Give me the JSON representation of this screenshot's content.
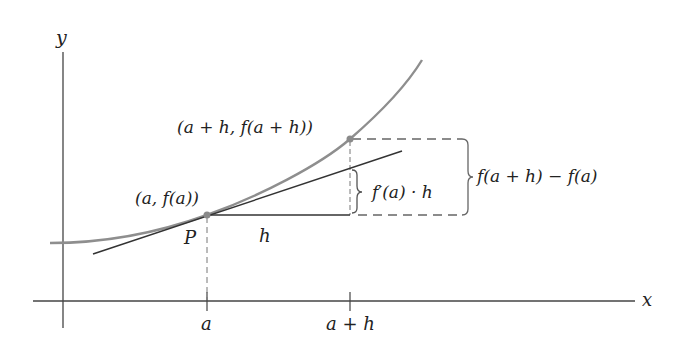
{
  "diagram": {
    "axes": {
      "x_label": "x",
      "y_label": "y",
      "ticks": [
        {
          "label": "a",
          "x": 207
        },
        {
          "label": "a + h",
          "x": 350
        }
      ]
    },
    "points": {
      "P": {
        "label": "P",
        "coord_label": "(a, f(a))",
        "x": 207,
        "y": 215
      },
      "Q": {
        "coord_label": "(a + h, f(a + h))",
        "x": 350,
        "y": 139
      }
    },
    "segment_labels": {
      "h": "h",
      "tangent_rise": "f′(a) · h",
      "actual_rise": "f(a + h) − f(a)"
    },
    "colors": {
      "curve": "#8e8e8e",
      "tangent": "#333333",
      "axis": "#444444",
      "dashed": "#666666",
      "point": "#8a8a8a",
      "text": "#222222"
    }
  }
}
